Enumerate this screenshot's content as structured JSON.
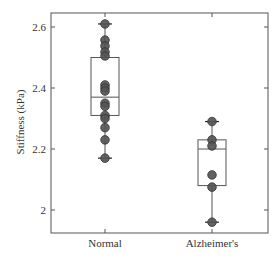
{
  "chart_data": {
    "type": "box",
    "title": "",
    "xlabel": "",
    "ylabel": "Stiffness (kPa)",
    "ylim": [
      1.925,
      2.646
    ],
    "yticks": [
      2,
      2.2,
      2.4,
      2.6
    ],
    "ytick_labels": [
      "2",
      "2.2",
      "2.4",
      "2.6"
    ],
    "categories": [
      "Normal",
      "Alzheimer's"
    ],
    "grid": false,
    "legend": null,
    "series": [
      {
        "name": "Normal",
        "box": {
          "min": 2.17,
          "q1": 2.31,
          "median": 2.37,
          "q3": 2.5,
          "max": 2.61
        },
        "points": [
          2.61,
          2.557,
          2.538,
          2.518,
          2.505,
          2.41,
          2.4,
          2.39,
          2.35,
          2.34,
          2.31,
          2.3,
          2.27,
          2.23,
          2.17
        ]
      },
      {
        "name": "Alzheimer's",
        "box": {
          "min": 1.96,
          "q1": 2.08,
          "median": 2.2,
          "q3": 2.23,
          "max": 2.29
        },
        "points": [
          2.29,
          2.23,
          2.21,
          2.115,
          2.075,
          1.96
        ]
      }
    ]
  },
  "colors": {
    "axis": "#555555",
    "box": "#555555",
    "marker_fill": "#555555",
    "marker_stroke": "#333333"
  }
}
